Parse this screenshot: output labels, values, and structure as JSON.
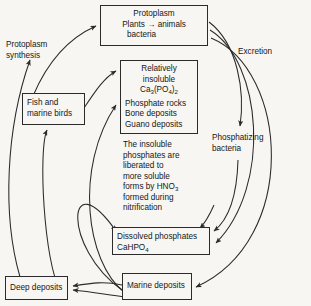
{
  "diagram": {
    "background_color": "#f7f6f3",
    "line_color": "#2b2b2b",
    "text_color": "#161616",
    "nodes": {
      "protoplasm": {
        "line1": "Protoplasm",
        "line2": "Plants → animals",
        "line3": "bacteria"
      },
      "insoluble": {
        "line1": "Relatively",
        "line2": "insoluble",
        "formula_base1": "Ca",
        "formula_sub1": "3",
        "formula_mid": "(PO",
        "formula_sub2": "4",
        "formula_close": ")",
        "formula_sub3": "2",
        "line4": "Phosphate rocks",
        "line5": "Bone deposits",
        "line6": "Guano deposits"
      },
      "fish": {
        "line1": "Fish and",
        "line2": "marine birds"
      },
      "note": {
        "line1": "The insoluble",
        "line2": "phosphates are",
        "line3": "liberated to",
        "line4": "more soluble",
        "line5_pre": "forms by HNO",
        "line5_sub": "3",
        "line6": "formed during",
        "line7": "nitrification"
      },
      "dissolved": {
        "line1": "Dissolved phosphates",
        "line2_pre": "CaHPO",
        "line2_sub": "4"
      },
      "marine": {
        "label": "Marine deposits"
      },
      "deep": {
        "label": "Deep deposits"
      }
    },
    "labels": {
      "synthesis_line1": "Protoplasm",
      "synthesis_line2": "synthesis",
      "excretion": "Excretion",
      "phosphatizing_line1": "Phosphatizing",
      "phosphatizing_line2": "bacteria"
    }
  }
}
